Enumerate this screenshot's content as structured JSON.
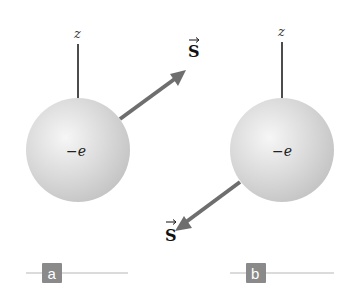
{
  "colors": {
    "sphere_light": "#f4f4f4",
    "sphere_mid": "#d2d2d2",
    "sphere_dark": "#bdbdbd",
    "arrow": "#6e6e6e",
    "axis": "#111111",
    "badge": "#8a8a8a",
    "badge_line": "#cfcfcf"
  },
  "panels": [
    {
      "id": "a",
      "axis_label": "z",
      "charge_label": "−e",
      "spin_label": "S",
      "spin_direction": "up-right",
      "badge_label": "a"
    },
    {
      "id": "b",
      "axis_label": "z",
      "charge_label": "−e",
      "spin_label": "S",
      "spin_direction": "down-left",
      "badge_label": "b"
    }
  ]
}
